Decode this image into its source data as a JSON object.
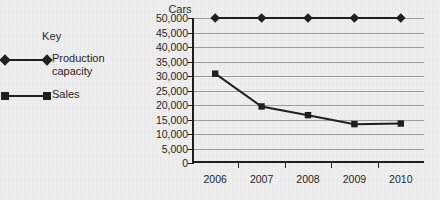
{
  "legend": {
    "title": "Key",
    "items": [
      {
        "label": "Production capacity",
        "marker": "diamond-marker-icon"
      },
      {
        "label": "Sales",
        "marker": "square-marker-icon"
      }
    ]
  },
  "chart_data": {
    "type": "line",
    "title": "",
    "xlabel": "",
    "ylabel": "Cars",
    "categories": [
      "2006",
      "2007",
      "2008",
      "2009",
      "2010"
    ],
    "ylim": [
      0,
      50000
    ],
    "ytick_step": 5000,
    "ytick_labels": [
      "50,000",
      "45,000",
      "40,000",
      "35,000",
      "30,000",
      "25,000",
      "20,000",
      "15,000",
      "10,000",
      "5,000",
      "0"
    ],
    "grid": true,
    "legend_position": "left",
    "series": [
      {
        "name": "Production capacity",
        "marker": "diamond",
        "color": "#1a1a1a",
        "values": [
          50000,
          50000,
          50000,
          50000,
          50000
        ]
      },
      {
        "name": "Sales",
        "marker": "square",
        "color": "#1a1a1a",
        "values": [
          30800,
          19500,
          16500,
          13400,
          13600
        ]
      }
    ]
  },
  "colors": {
    "background": "#eeeeee",
    "ink": "#1a1a1a",
    "grid": "#9a9a9a"
  }
}
